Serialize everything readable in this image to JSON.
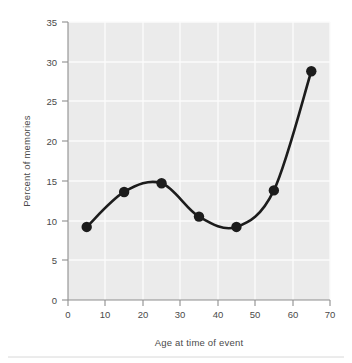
{
  "chart_data": {
    "type": "line",
    "title": "",
    "xlabel": "Age at time of event",
    "ylabel": "Percent of memories",
    "xlim": [
      0,
      70
    ],
    "ylim": [
      0,
      35
    ],
    "xticks": [
      0,
      10,
      20,
      30,
      40,
      50,
      60,
      70
    ],
    "yticks": [
      0,
      5,
      10,
      15,
      20,
      25,
      30,
      35
    ],
    "xtick_labels": [
      "0",
      "10",
      "20",
      "30",
      "40",
      "50",
      "60",
      "70"
    ],
    "ytick_labels": [
      "0",
      "5",
      "10",
      "15",
      "20",
      "25",
      "30",
      "35"
    ],
    "grid": true,
    "legend": null,
    "marker": "filled-circle",
    "line_style": "smooth-spline",
    "series": [
      {
        "name": "Percent of memories",
        "color": "#1c1c1c",
        "x": [
          5,
          15,
          25,
          35,
          45,
          55,
          65
        ],
        "values": [
          9.2,
          13.6,
          14.7,
          10.5,
          9.2,
          13.8,
          28.8
        ]
      }
    ],
    "plot_background": "#ebebeb",
    "gridline_color": "#fbfbfb",
    "axis_color": "#8e8e8e",
    "text_color": "#4a4a4a"
  }
}
